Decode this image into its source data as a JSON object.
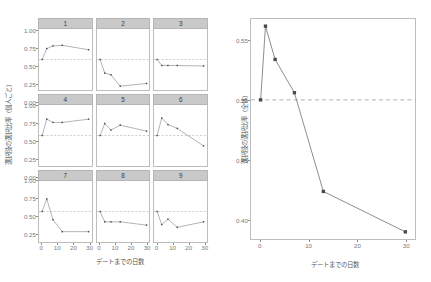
{
  "figure": {
    "title": "",
    "left_panel_label": "individual-facets",
    "right_panel_label": "overall"
  },
  "chart_data": [
    {
      "type": "line",
      "id": "individual-facets",
      "title": "",
      "xlabel": "デートまでの日数",
      "ylabel": "選択肢の選択比率（個人ごと）",
      "xlim": [
        -2,
        32
      ],
      "ylim": [
        -0.06,
        1.06
      ],
      "xticks": [
        0,
        10,
        20,
        30
      ],
      "yticks": [
        0.0,
        0.25,
        0.5,
        0.75,
        1.0
      ],
      "ytick_labels": [
        "0.00",
        "0.25",
        "0.50",
        "0.75",
        "1.00"
      ],
      "xtick_labels": [
        "0",
        "10",
        "20",
        "30"
      ],
      "grid": false,
      "reference_line": 0.5,
      "legend": "none",
      "facet_labels": [
        "1",
        "2",
        "3",
        "4",
        "5",
        "6",
        "7",
        "8",
        "9"
      ],
      "x": [
        0,
        3,
        7,
        13,
        30
      ],
      "series": [
        {
          "name": "1",
          "values": [
            0.5,
            0.7,
            0.75,
            0.76,
            0.68
          ]
        },
        {
          "name": "2",
          "values": [
            0.5,
            0.25,
            0.22,
            0.01,
            0.06
          ]
        },
        {
          "name": "3",
          "values": [
            0.5,
            0.39,
            0.39,
            0.39,
            0.38
          ]
        },
        {
          "name": "4",
          "values": [
            0.5,
            0.8,
            0.74,
            0.74,
            0.8
          ]
        },
        {
          "name": "5",
          "values": [
            0.5,
            0.72,
            0.6,
            0.69,
            0.58
          ]
        },
        {
          "name": "6",
          "values": [
            0.5,
            0.82,
            0.7,
            0.63,
            0.31
          ]
        },
        {
          "name": "7",
          "values": [
            0.5,
            0.73,
            0.35,
            0.13,
            0.13
          ]
        },
        {
          "name": "8",
          "values": [
            0.5,
            0.31,
            0.31,
            0.31,
            0.25
          ]
        },
        {
          "name": "9",
          "values": [
            0.5,
            0.26,
            0.36,
            0.21,
            0.31
          ]
        }
      ]
    },
    {
      "type": "line",
      "id": "overall",
      "title": "",
      "xlabel": "デートまでの日数",
      "ylabel": "選択肢の選択比率（全体）",
      "xlim": [
        -2,
        32
      ],
      "ylim": [
        0.383,
        0.568
      ],
      "xticks": [
        0,
        10,
        20,
        30
      ],
      "yticks": [
        0.4,
        0.45,
        0.5,
        0.55
      ],
      "ytick_labels": [
        "0.40",
        "0.45",
        "0.50",
        "0.55"
      ],
      "xtick_labels": [
        "0",
        "10",
        "20",
        "30"
      ],
      "grid": false,
      "reference_line": 0.5,
      "legend": "none",
      "x": [
        0,
        1,
        3,
        7,
        13,
        30
      ],
      "values": [
        0.5,
        0.562,
        0.534,
        0.506,
        0.423,
        0.389
      ]
    }
  ],
  "left": {
    "ylabel": "選択肢の選択比率（個人ごと）",
    "xlabel": "デートまでの日数",
    "ytick_labels": [
      "1.00",
      "0.75",
      "0.50",
      "0.25",
      "0.00"
    ],
    "xtick_labels": [
      "0",
      "10",
      "20",
      "30"
    ],
    "facets": [
      {
        "label": "1"
      },
      {
        "label": "2"
      },
      {
        "label": "3"
      },
      {
        "label": "4"
      },
      {
        "label": "5"
      },
      {
        "label": "6"
      },
      {
        "label": "7"
      },
      {
        "label": "8"
      },
      {
        "label": "9"
      }
    ]
  },
  "right": {
    "ylabel": "選択肢の選択比率（全体）",
    "xlabel": "デートまでの日数",
    "ytick_labels": [
      "0.55",
      "0.50",
      "0.45",
      "0.40"
    ],
    "xtick_labels": [
      "0",
      "10",
      "20",
      "30"
    ]
  },
  "colors": {
    "line": "#707070",
    "point": "#4a4a4a",
    "reference_dash": "#9a9a9a",
    "strip_fill": "#c9c9c9",
    "panel_border": "#bdbdbd",
    "axis_text": "#7a7a7a",
    "background": "#ffffff"
  }
}
